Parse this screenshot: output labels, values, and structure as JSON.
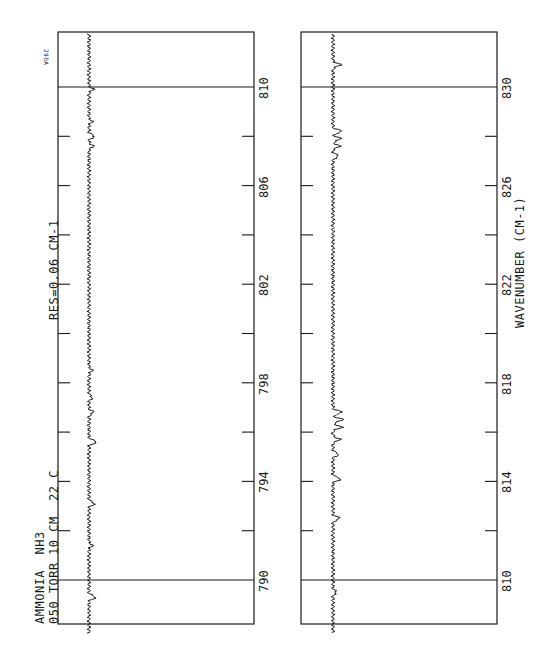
{
  "chart_data": {
    "type": "line",
    "title": "AMMONIA NH3",
    "annotations": {
      "sample": "AMMONIA  NH3",
      "conditions": "050 TORR  10 CM  22 C",
      "resolution": "RES=0.06 CM-1",
      "plate_id": "290A"
    },
    "xlabel": "WAVENUMBER (CM-1)",
    "ylabel": "",
    "orientation": "rotated 90deg (wavenumber increases upward on page)",
    "grid": false,
    "panels": [
      {
        "name": "panel-1",
        "xlim": [
          787.8,
          812.2
        ],
        "tick_labels": [
          "790",
          "794",
          "798",
          "802",
          "806",
          "810"
        ],
        "minor_ticks": [
          792,
          796,
          800,
          804,
          808
        ],
        "reference_lines": [
          790,
          810
        ],
        "series": [
          {
            "name": "transmittance",
            "baseline": 0.95,
            "peaks": [
              {
                "x": 789.3,
                "depth": 0.06
              },
              {
                "x": 791.4,
                "depth": 0.03
              },
              {
                "x": 793.1,
                "depth": 0.05
              },
              {
                "x": 795.6,
                "depth": 0.07
              },
              {
                "x": 796.8,
                "depth": 0.04
              },
              {
                "x": 797.4,
                "depth": 0.03
              },
              {
                "x": 798.5,
                "depth": 0.03
              },
              {
                "x": 807.6,
                "depth": 0.04
              },
              {
                "x": 808.0,
                "depth": 0.05
              },
              {
                "x": 808.6,
                "depth": 0.03
              },
              {
                "x": 809.9,
                "depth": 0.04
              }
            ]
          }
        ]
      },
      {
        "name": "panel-2",
        "xlim": [
          807.8,
          832.2
        ],
        "tick_labels": [
          "810",
          "814",
          "818",
          "822",
          "826",
          "830"
        ],
        "minor_ticks": [
          812,
          816,
          820,
          824,
          828
        ],
        "reference_lines": [
          810,
          830
        ],
        "series": [
          {
            "name": "transmittance",
            "baseline": 0.95,
            "peaks": [
              {
                "x": 809.5,
                "depth": 0.03
              },
              {
                "x": 812.5,
                "depth": 0.06
              },
              {
                "x": 814.1,
                "depth": 0.07
              },
              {
                "x": 815.1,
                "depth": 0.05
              },
              {
                "x": 815.7,
                "depth": 0.06
              },
              {
                "x": 816.2,
                "depth": 0.08
              },
              {
                "x": 816.5,
                "depth": 0.09
              },
              {
                "x": 816.8,
                "depth": 0.08
              },
              {
                "x": 827.2,
                "depth": 0.05
              },
              {
                "x": 827.6,
                "depth": 0.06
              },
              {
                "x": 827.9,
                "depth": 0.07
              },
              {
                "x": 828.2,
                "depth": 0.08
              },
              {
                "x": 830.9,
                "depth": 0.07
              }
            ]
          }
        ]
      }
    ]
  },
  "labels": {
    "sample": "AMMONIA  NH3",
    "conditions_left": "050 TORR",
    "conditions_right": "10 CM  22 C",
    "resolution": "RES=0.06 CM-1",
    "plate_id": "290A",
    "xlabel": "WAVENUMBER (CM-1)"
  },
  "layout": {
    "line_color": "#1a1a1a",
    "background": "#ffffff"
  }
}
